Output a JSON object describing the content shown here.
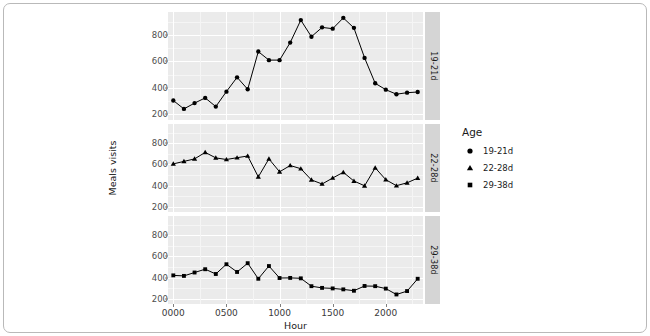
{
  "figure": {
    "background": "#ffffff",
    "panel_background": "#ebebeb",
    "grid_color": "#ffffff",
    "strip_background": "#d5d5d5",
    "marker_color": "#000000",
    "line_color": "#000000"
  },
  "axis": {
    "y_title": "Meals visits",
    "x_title": "Hour",
    "y_ticks": [
      200,
      400,
      600,
      800
    ],
    "y_tick_labels": [
      "200",
      "400",
      "600",
      "800"
    ],
    "x_ticks": [
      0,
      500,
      1000,
      1500,
      2000
    ],
    "x_tick_labels": [
      "0000",
      "0500",
      "1000",
      "1500",
      "2000"
    ]
  },
  "legend": {
    "title": "Age",
    "position": "right",
    "items": [
      {
        "label": "19-21d",
        "marker": "circle"
      },
      {
        "label": "22-28d",
        "marker": "triangle"
      },
      {
        "label": "29-38d",
        "marker": "square"
      }
    ]
  },
  "strips": [
    {
      "label": "19-21d"
    },
    {
      "label": "22-28d"
    },
    {
      "label": "29-38d"
    }
  ],
  "chart_data": {
    "type": "line",
    "title": "",
    "subtitle": "",
    "xlabel": "Hour",
    "ylabel": "Meals visits",
    "grid": true,
    "legend_position": "right",
    "legend_title": "Age",
    "facet_variable": "Age",
    "facet_labels": [
      "19-21d",
      "22-28d",
      "29-38d"
    ],
    "xlim": [
      -50,
      2350
    ],
    "ylim": [
      150,
      980
    ],
    "x": [
      0,
      100,
      200,
      300,
      400,
      500,
      600,
      700,
      800,
      900,
      1000,
      1100,
      1200,
      1300,
      1400,
      1500,
      1600,
      1700,
      1800,
      1900,
      2000,
      2100,
      2200,
      2300
    ],
    "x_tick_labels": [
      "0000",
      "0500",
      "1000",
      "1500",
      "2000"
    ],
    "series": [
      {
        "name": "19-21d",
        "marker": "circle",
        "panel": 0,
        "values": [
          300,
          235,
          280,
          320,
          253,
          368,
          478,
          386,
          676,
          610,
          610,
          745,
          918,
          790,
          862,
          852,
          935,
          858,
          627,
          432,
          383,
          348,
          360,
          365
        ]
      },
      {
        "name": "22-28d",
        "marker": "triangle",
        "panel": 1,
        "values": [
          604,
          627,
          651,
          712,
          660,
          645,
          662,
          678,
          481,
          651,
          529,
          589,
          558,
          453,
          414,
          471,
          524,
          442,
          397,
          567,
          455,
          398,
          425,
          470
        ]
      },
      {
        "name": "29-38d",
        "marker": "square",
        "panel": 2,
        "values": [
          420,
          415,
          447,
          478,
          433,
          525,
          452,
          535,
          388,
          508,
          395,
          396,
          392,
          318,
          302,
          297,
          288,
          275,
          320,
          318,
          295,
          240,
          272,
          388
        ]
      }
    ],
    "series_extra_note": {
      "22-28d_tail": [
        536,
        590
      ],
      "29-38d_tail": [
        390,
        386
      ]
    }
  }
}
